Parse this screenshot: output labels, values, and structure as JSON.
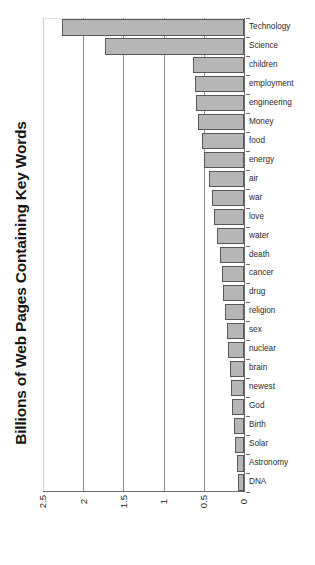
{
  "chart_data": {
    "type": "bar",
    "orientation": "horizontal",
    "title": "",
    "xlabel": "",
    "ylabel": "Billions of Web Pages Containing Key Words",
    "axis_title": "Billions of Web Pages Containing Key Words",
    "value_axis_direction": "right-to-left (0 at right)",
    "xlim": [
      0,
      2.5
    ],
    "grid": true,
    "gridlines": [
      2.5,
      2.0,
      1.5,
      1.0,
      0.5,
      0
    ],
    "tick_labels": [
      "2.5",
      "2",
      "1.5",
      "1",
      "0.5",
      "0"
    ],
    "legend": null,
    "bar_color": "#b6b6b6",
    "bar_edge_color": "#58585a",
    "categories": [
      "Technology",
      "Science",
      "children",
      "employment",
      "engineering",
      "Money",
      "food",
      "energy",
      "air",
      "war",
      "love",
      "water",
      "death",
      "cancer",
      "drug",
      "religion",
      "sex",
      "nuclear",
      "brain",
      "newest",
      "God",
      "Birth",
      "Solar",
      "Astronomy",
      "DNA"
    ],
    "values": [
      2.26,
      1.73,
      0.64,
      0.61,
      0.6,
      0.57,
      0.52,
      0.5,
      0.43,
      0.4,
      0.37,
      0.34,
      0.3,
      0.28,
      0.26,
      0.24,
      0.21,
      0.2,
      0.18,
      0.16,
      0.15,
      0.13,
      0.11,
      0.09,
      0.07
    ]
  }
}
